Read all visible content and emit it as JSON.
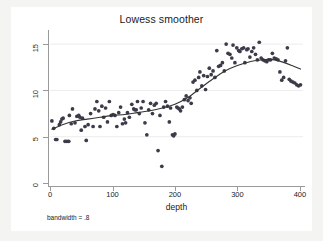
{
  "chart_data": {
    "type": "scatter",
    "title": "Lowess smoother",
    "xlabel": "depth",
    "ylabel": "Wet hole 1",
    "note": "bandwidth = .8",
    "grid": "horizontal-faint",
    "legend": "none",
    "xlim": [
      0,
      405
    ],
    "ylim": [
      0,
      16.2
    ],
    "xticks": [
      0,
      100,
      200,
      300,
      400
    ],
    "yticks": [
      0,
      5,
      10,
      15
    ],
    "xtick_labels": [
      "0",
      "100",
      "200",
      "300",
      "400"
    ],
    "ytick_labels": [
      "0",
      "5",
      "10",
      "15"
    ],
    "marker_color": "#3b3b4a",
    "line_color": "#333333",
    "background_color": "#ffffff",
    "figure_color": "#f4f4f3",
    "series": [
      {
        "name": "observations",
        "type": "scatter",
        "points": [
          [
            3,
            6.7
          ],
          [
            6,
            5.9
          ],
          [
            9,
            4.7
          ],
          [
            11,
            4.7
          ],
          [
            15,
            6.3
          ],
          [
            17,
            6.6
          ],
          [
            19,
            6.9
          ],
          [
            21,
            7.0
          ],
          [
            24,
            4.5
          ],
          [
            27,
            4.5
          ],
          [
            30,
            4.5
          ],
          [
            31,
            7.3
          ],
          [
            34,
            6.4
          ],
          [
            36,
            8.0
          ],
          [
            40,
            6.5
          ],
          [
            43,
            7.2
          ],
          [
            46,
            7.3
          ],
          [
            48,
            7.1
          ],
          [
            50,
            5.7
          ],
          [
            52,
            7.0
          ],
          [
            56,
            6.1
          ],
          [
            58,
            4.6
          ],
          [
            61,
            6.3
          ],
          [
            65,
            7.5
          ],
          [
            69,
            6.1
          ],
          [
            72,
            8.0
          ],
          [
            75,
            8.8
          ],
          [
            78,
            7.8
          ],
          [
            80,
            6.1
          ],
          [
            83,
            8.3
          ],
          [
            86,
            7.1
          ],
          [
            89,
            8.1
          ],
          [
            92,
            6.6
          ],
          [
            95,
            8.8
          ],
          [
            98,
            7.3
          ],
          [
            101,
            7.4
          ],
          [
            104,
            7.3
          ],
          [
            107,
            6.1
          ],
          [
            110,
            7.6
          ],
          [
            113,
            8.2
          ],
          [
            116,
            6.4
          ],
          [
            119,
            6.9
          ],
          [
            121,
            6.5
          ],
          [
            124,
            7.6
          ],
          [
            127,
            7.1
          ],
          [
            131,
            8.5
          ],
          [
            134,
            8.0
          ],
          [
            136,
            7.9
          ],
          [
            138,
            7.9
          ],
          [
            140,
            8.8
          ],
          [
            143,
            7.5
          ],
          [
            146,
            8.1
          ],
          [
            149,
            8.8
          ],
          [
            152,
            6.5
          ],
          [
            155,
            5.2
          ],
          [
            158,
            7.9
          ],
          [
            161,
            8.6
          ],
          [
            164,
            7.5
          ],
          [
            167,
            8.4
          ],
          [
            170,
            8.6
          ],
          [
            173,
            3.5
          ],
          [
            176,
            7.3
          ],
          [
            179,
            1.8
          ],
          [
            182,
            8.2
          ],
          [
            185,
            8.8
          ],
          [
            188,
            8.3
          ],
          [
            191,
            6.6
          ],
          [
            193,
            8.1
          ],
          [
            196,
            5.2
          ],
          [
            198,
            5.1
          ],
          [
            200,
            5.3
          ],
          [
            203,
            8.2
          ],
          [
            205,
            8.1
          ],
          [
            207,
            8.0
          ],
          [
            209,
            7.8
          ],
          [
            212,
            8.2
          ],
          [
            215,
            9.0
          ],
          [
            218,
            9.4
          ],
          [
            221,
            8.9
          ],
          [
            224,
            9.2
          ],
          [
            226,
            8.6
          ],
          [
            229,
            10.9
          ],
          [
            232,
            11.1
          ],
          [
            235,
            10.0
          ],
          [
            238,
            11.4
          ],
          [
            240,
            12.0
          ],
          [
            243,
            10.5
          ],
          [
            246,
            11.6
          ],
          [
            249,
            10.1
          ],
          [
            252,
            11.5
          ],
          [
            255,
            12.4
          ],
          [
            258,
            11.7
          ],
          [
            261,
            12.1
          ],
          [
            264,
            11.4
          ],
          [
            267,
            14.3
          ],
          [
            270,
            12.6
          ],
          [
            273,
            12.7
          ],
          [
            276,
            13.0
          ],
          [
            279,
            12.1
          ],
          [
            282,
            15.0
          ],
          [
            285,
            14.0
          ],
          [
            288,
            13.9
          ],
          [
            291,
            13.5
          ],
          [
            293,
            14.9
          ],
          [
            296,
            13.0
          ],
          [
            299,
            14.6
          ],
          [
            302,
            14.3
          ],
          [
            304,
            14.2
          ],
          [
            307,
            14.5
          ],
          [
            310,
            14.6
          ],
          [
            312,
            13.0
          ],
          [
            315,
            14.4
          ],
          [
            317,
            14.5
          ],
          [
            320,
            13.6
          ],
          [
            323,
            14.2
          ],
          [
            326,
            14.6
          ],
          [
            329,
            13.9
          ],
          [
            332,
            13.3
          ],
          [
            335,
            15.2
          ],
          [
            338,
            13.5
          ],
          [
            341,
            13.3
          ],
          [
            344,
            13.2
          ],
          [
            347,
            13.1
          ],
          [
            350,
            13.3
          ],
          [
            353,
            13.3
          ],
          [
            356,
            14.0
          ],
          [
            359,
            13.5
          ],
          [
            362,
            13.4
          ],
          [
            365,
            13.3
          ],
          [
            368,
            12.0
          ],
          [
            371,
            11.1
          ],
          [
            374,
            11.4
          ],
          [
            377,
            13.2
          ],
          [
            380,
            14.6
          ],
          [
            383,
            11.2
          ],
          [
            386,
            11.0
          ],
          [
            389,
            10.9
          ],
          [
            392,
            10.8
          ],
          [
            395,
            10.6
          ],
          [
            398,
            10.5
          ],
          [
            401,
            10.6
          ]
        ]
      },
      {
        "name": "lowess-smooth",
        "type": "line",
        "points": [
          [
            3,
            5.8
          ],
          [
            20,
            6.3
          ],
          [
            40,
            6.7
          ],
          [
            60,
            6.9
          ],
          [
            80,
            7.1
          ],
          [
            100,
            7.3
          ],
          [
            120,
            7.4
          ],
          [
            140,
            7.6
          ],
          [
            160,
            7.8
          ],
          [
            180,
            8.1
          ],
          [
            200,
            8.5
          ],
          [
            220,
            9.2
          ],
          [
            240,
            10.2
          ],
          [
            260,
            11.2
          ],
          [
            280,
            12.1
          ],
          [
            300,
            12.7
          ],
          [
            320,
            13.1
          ],
          [
            340,
            13.3
          ],
          [
            350,
            13.35
          ],
          [
            360,
            13.3
          ],
          [
            375,
            13.0
          ],
          [
            390,
            12.6
          ],
          [
            401,
            12.3
          ]
        ]
      }
    ]
  }
}
